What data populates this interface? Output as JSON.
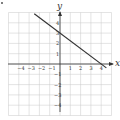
{
  "chart_data": {
    "type": "line",
    "title": "",
    "xlabel": "x",
    "ylabel": "y",
    "xlim": [
      -5,
      5
    ],
    "ylim": [
      -5,
      5
    ],
    "grid": true,
    "x_ticks": [
      "-4",
      "-3",
      "-2",
      "-1",
      "1",
      "2",
      "3",
      "4"
    ],
    "y_ticks": [
      "4",
      "3",
      "2",
      "1",
      "-1",
      "-2",
      "-3",
      "-4"
    ],
    "series": [
      {
        "name": "line",
        "equation": "y = -3/4 x + 3",
        "x": [
          -2.5,
          0,
          4,
          4.5
        ],
        "y": [
          4.875,
          3,
          0,
          -0.375
        ]
      }
    ],
    "color": "#333333"
  }
}
